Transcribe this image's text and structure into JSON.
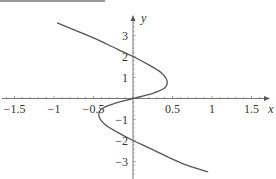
{
  "chart_data": {
    "type": "line",
    "title": "",
    "xlabel": "x",
    "ylabel": "y",
    "xlim": [
      -1.6,
      1.7
    ],
    "ylim": [
      -3.6,
      4.0
    ],
    "grid": false,
    "x_ticks": [
      "-1.5",
      "-1",
      "-0.5",
      "0.5",
      "1",
      "1.5"
    ],
    "y_ticks": [
      "3",
      "2",
      "1",
      "-1",
      "-2",
      "-3"
    ],
    "series": [
      {
        "name": "curve",
        "description": "S-shaped curve x = f(y), odd symmetric, crosses y-axis at y=-2, 0, 2; max x≈0.43 at y≈0.8, min x≈-0.43 at y≈-0.8",
        "points": [
          [
            -0.96,
            3.6
          ],
          [
            -0.7,
            3.2
          ],
          [
            -0.45,
            2.8
          ],
          [
            -0.2,
            2.35
          ],
          [
            0.0,
            2.0
          ],
          [
            0.2,
            1.6
          ],
          [
            0.35,
            1.25
          ],
          [
            0.43,
            0.85
          ],
          [
            0.4,
            0.5
          ],
          [
            0.25,
            0.25
          ],
          [
            0.0,
            0.0
          ],
          [
            -0.25,
            -0.25
          ],
          [
            -0.4,
            -0.5
          ],
          [
            -0.43,
            -0.85
          ],
          [
            -0.35,
            -1.25
          ],
          [
            -0.2,
            -1.6
          ],
          [
            0.0,
            -2.0
          ],
          [
            0.2,
            -2.35
          ],
          [
            0.45,
            -2.8
          ],
          [
            0.7,
            -3.2
          ],
          [
            0.95,
            -3.5
          ]
        ]
      }
    ]
  }
}
